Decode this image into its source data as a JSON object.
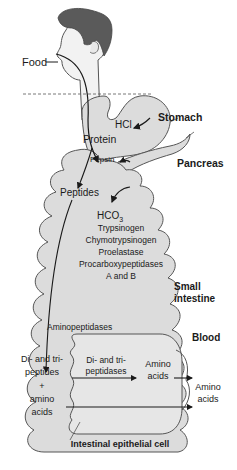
{
  "diagram": {
    "labels": {
      "food": "Food",
      "hcl": "HCl",
      "stomach": "Stomach",
      "protein": "Protein",
      "pepsin": "Pepsin",
      "pancreas": "Pancreas",
      "peptides": "Peptides",
      "hco3_main": "HCO",
      "hco3_sub": "3",
      "trypsinogen": "Trypsinogen",
      "chymotrypsinogen": "Chymotrypsinogen",
      "proelastase": "Proelastase",
      "procarboxypeptidases": "Procarboxypeptidases",
      "a_and_b": "A and B",
      "small": "Small",
      "intestine": "intestine",
      "aminopeptidases": "Aminopeptidases",
      "blood": "Blood",
      "lumen_line1": "Di- and tri-",
      "lumen_line2": "peptides",
      "lumen_line3": "+",
      "lumen_line4": "amino",
      "lumen_line5": "acids",
      "cell_enzyme_line1": "Di- and tri-",
      "cell_enzyme_line2": "peptidases",
      "cell_amino_line1": "Amino",
      "cell_amino_line2": "acids",
      "blood_amino_line1": "Amino",
      "blood_amino_line2": "acids",
      "epithelial_cell": "Intestinal epithelial cell"
    },
    "colors": {
      "organ_fill": "#dcdcdc",
      "outline": "#555555",
      "hair": "#5a5a5a",
      "skin": "#f2f2f2",
      "text": "#1a1a1a"
    }
  }
}
